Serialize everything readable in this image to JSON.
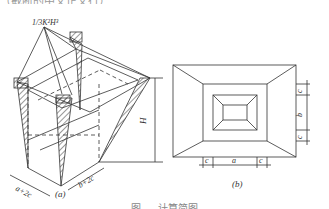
{
  "top_text": "（截断的中文正文行）",
  "figure": {
    "panel_a": {
      "apex_label": "1/3K²H³",
      "height_label": "H",
      "width_label_1": "a+2c",
      "width_label_2": "b+2c",
      "caption": "(a)"
    },
    "panel_b": {
      "dim_c_top": "c",
      "dim_b": "b",
      "dim_c_bottom": "c",
      "dim_c_left": "c",
      "dim_a": "a",
      "dim_c_right": "c",
      "caption": "(b)"
    },
    "figure_caption": "图 … 计算简图"
  },
  "colors": {
    "line": "#333333",
    "background": "#ffffff"
  }
}
